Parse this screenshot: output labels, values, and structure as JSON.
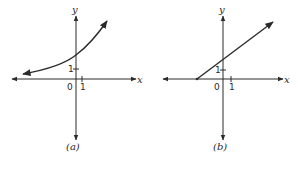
{
  "panels": [
    {
      "id": "a",
      "caption": "(a)",
      "x_axis_label": "x",
      "y_axis_label": "y",
      "origin_label": "0",
      "x_tick_label": "1",
      "y_tick_label": "1",
      "curve": "exponential-growth"
    },
    {
      "id": "b",
      "caption": "(b)",
      "x_axis_label": "x",
      "y_axis_label": "y",
      "origin_label": "0",
      "x_tick_label": "1",
      "y_tick_label": "1",
      "curve": "ray-line"
    }
  ],
  "colors": {
    "ink": "#2a2a2a",
    "background": "#ffffff"
  }
}
